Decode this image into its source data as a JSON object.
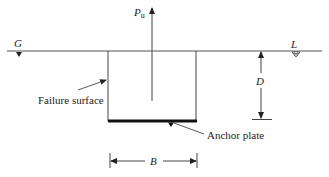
{
  "diagram": {
    "type": "anchor-plate-uplift-schematic",
    "labels": {
      "load": "P",
      "load_subscript": "u",
      "ground_left": "G",
      "ground_right": "L",
      "depth": "D",
      "width": "B",
      "failure_surface": "Failure surface",
      "anchor_plate": "Anchor plate"
    },
    "colors": {
      "line": "#444444",
      "plate": "#111111",
      "text": "#222222"
    }
  }
}
